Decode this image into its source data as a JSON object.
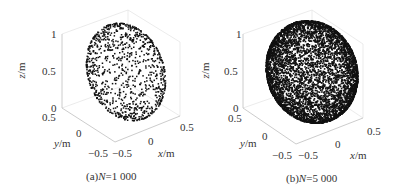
{
  "chart_data": [
    {
      "type": "scatter",
      "subtype": "3d-scatter",
      "caption": "(a)N=1 000",
      "caption_prefix": "(a)",
      "caption_var": "N",
      "caption_value": "=1 000",
      "N": 1000,
      "description": "Points uniformly distributed on a spherical cap surface (hemisphere-like shell)",
      "xlabel": "x/m",
      "ylabel": "y/m",
      "zlabel": "z/m",
      "xticks": [
        "-0.5",
        "0",
        "0.5"
      ],
      "yticks": [
        "-0.5",
        "0",
        "0.5"
      ],
      "zticks": [
        "0",
        "0.5",
        "1"
      ],
      "xlim": [
        -0.5,
        0.5
      ],
      "ylim": [
        -0.5,
        0.5
      ],
      "zlim": [
        0,
        1
      ],
      "marker_color": "#111111",
      "grid": false
    },
    {
      "type": "scatter",
      "subtype": "3d-scatter",
      "caption": "(b)N=5 000",
      "caption_prefix": "(b)",
      "caption_var": "N",
      "caption_value": "=5 000",
      "N": 5000,
      "description": "Points uniformly distributed on a spherical cap surface, denser sampling",
      "xlabel": "x/m",
      "ylabel": "y/m",
      "zlabel": "z/m",
      "xticks": [
        "-0.5",
        "0",
        "0.5"
      ],
      "yticks": [
        "-0.5",
        "0",
        "0.5"
      ],
      "zticks": [
        "0",
        "0.5",
        "1"
      ],
      "xlim": [
        -0.5,
        0.5
      ],
      "ylim": [
        -0.5,
        0.5
      ],
      "zlim": [
        0,
        1
      ],
      "marker_color": "#111111",
      "grid": false
    }
  ],
  "panels": [
    {
      "z_axis_label": "z/m",
      "z_axis_var": "z",
      "z_axis_unit": "/m",
      "y_axis_var": "y",
      "y_axis_unit": "/m",
      "x_axis_var": "x",
      "x_axis_unit": "/m",
      "z_ticks": [
        "1",
        "0.5",
        "0"
      ],
      "y_tick_top": "0.5",
      "y_tick_mid": "0",
      "y_tick_bottom": "−0.5",
      "x_tick_left": "−0.5",
      "x_tick_mid": "0",
      "x_tick_right": "0.5",
      "caption_prefix": "(a)",
      "caption_var": "N",
      "caption_value": "=1 000"
    },
    {
      "z_axis_label": "z/m",
      "z_axis_var": "z",
      "z_axis_unit": "/m",
      "y_axis_var": "y",
      "y_axis_unit": "/m",
      "x_axis_var": "x",
      "x_axis_unit": "/m",
      "z_ticks": [
        "1",
        "0.5",
        "0"
      ],
      "y_tick_top": "0.5",
      "y_tick_mid": "0",
      "y_tick_bottom": "−0.5",
      "x_tick_left": "−0.5",
      "x_tick_mid": "0",
      "x_tick_right": "0.5",
      "caption_prefix": "(b)",
      "caption_var": "N",
      "caption_value": "=5 000"
    }
  ],
  "colors": {
    "points": "#111111",
    "axes": "#bfbfbf",
    "frame": "#e6e6e6",
    "text": "#333333"
  }
}
